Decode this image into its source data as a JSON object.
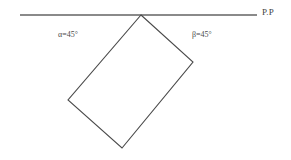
{
  "figure": {
    "type": "geometry-diagram",
    "background_color": "#ffffff",
    "line_color": "#4a4a4a",
    "stroke_width": 1,
    "width": 291,
    "height": 160
  },
  "picture_plane": {
    "name": "picture-plane-line",
    "label": "P.P",
    "x1": 20,
    "y1": 15,
    "x2": 257,
    "y2": 15,
    "color": "#8a8a8a"
  },
  "rectangle": {
    "name": "rotated-rectangle",
    "points": "141,15 193,62 122,148 68,100",
    "vertices": [
      {
        "name": "top-vertex",
        "x": 141,
        "y": 15
      },
      {
        "name": "right-vertex",
        "x": 193,
        "y": 62
      },
      {
        "name": "bottom-vertex",
        "x": 122,
        "y": 148
      },
      {
        "name": "left-vertex",
        "x": 68,
        "y": 100
      }
    ],
    "color": "#4a4a4a"
  },
  "angles": {
    "alpha": {
      "symbol": "α",
      "equals": "=45°",
      "full": "α=45°",
      "value": 45,
      "unit": "degrees",
      "x": 75,
      "y": 36
    },
    "beta": {
      "symbol": "β",
      "equals": "=45°",
      "full": "β=45°",
      "value": 45,
      "unit": "degrees",
      "x": 206,
      "y": 36
    }
  }
}
